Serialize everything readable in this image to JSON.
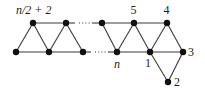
{
  "diagram": {
    "type": "graph",
    "labels": {
      "top_left": "n/2 + 2",
      "v5": "5",
      "v4": "4",
      "v3": "3",
      "v2": "2",
      "v1": "1",
      "vn": "n"
    },
    "nodes": [
      {
        "id": "t1",
        "x": 33,
        "y": 23
      },
      {
        "id": "t2",
        "x": 66,
        "y": 23
      },
      {
        "id": "t3",
        "x": 102,
        "y": 23
      },
      {
        "id": "v5",
        "x": 134,
        "y": 23
      },
      {
        "id": "v4",
        "x": 167,
        "y": 23
      },
      {
        "id": "b1",
        "x": 16,
        "y": 52
      },
      {
        "id": "b2",
        "x": 49,
        "y": 52
      },
      {
        "id": "b3",
        "x": 83,
        "y": 52
      },
      {
        "id": "vn",
        "x": 117,
        "y": 52
      },
      {
        "id": "v1",
        "x": 150,
        "y": 52
      },
      {
        "id": "v3",
        "x": 183,
        "y": 52
      },
      {
        "id": "v2",
        "x": 168,
        "y": 82
      }
    ],
    "edges": [
      [
        "t1",
        "t2"
      ],
      [
        "t3",
        "v5"
      ],
      [
        "v5",
        "v4"
      ],
      [
        "b1",
        "b2"
      ],
      [
        "b2",
        "b3"
      ],
      [
        "vn",
        "v1"
      ],
      [
        "v1",
        "v3"
      ],
      [
        "b1",
        "t1"
      ],
      [
        "t1",
        "b2"
      ],
      [
        "b2",
        "t2"
      ],
      [
        "t2",
        "b3"
      ],
      [
        "t3",
        "vn"
      ],
      [
        "vn",
        "v5"
      ],
      [
        "v5",
        "v1"
      ],
      [
        "v1",
        "v4"
      ],
      [
        "v4",
        "v3"
      ],
      [
        "v1",
        "v2"
      ],
      [
        "v3",
        "v2"
      ]
    ],
    "dotted_edges": [
      [
        "t2",
        "t3"
      ],
      [
        "b3",
        "vn"
      ]
    ]
  }
}
